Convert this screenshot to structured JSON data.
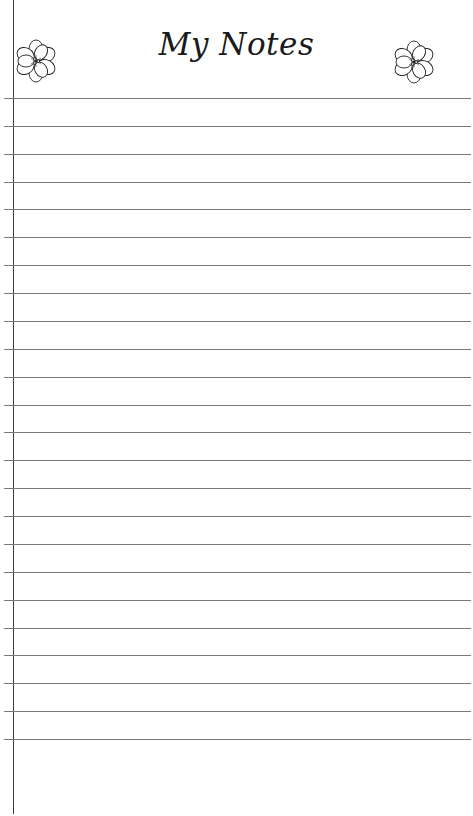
{
  "title": "My Notes",
  "decorations": {
    "left_icon": "flower-icon",
    "right_icon": "flower-icon"
  },
  "ruled_lines": {
    "count": 24,
    "first_y": 98,
    "spacing": 27.87,
    "color": "#7a7a7a"
  },
  "margin_line": {
    "x": 13,
    "color": "#3a3a3a"
  }
}
